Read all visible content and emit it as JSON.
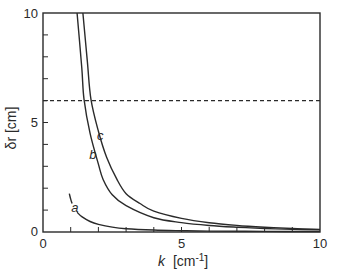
{
  "chart_data": {
    "type": "line",
    "title": "",
    "xlabel": "k [cm-1]",
    "xlabel_var": "k",
    "xlabel_unit": "[cm",
    "xlabel_exp": "-1",
    "xlabel_close": "]",
    "ylabel": "δr [cm]",
    "xlim": [
      0,
      10
    ],
    "ylim": [
      0,
      10
    ],
    "x_ticks_major": [
      0,
      5,
      10
    ],
    "x_tick_labels": [
      "0",
      "5",
      "10"
    ],
    "x_ticks_minor_step": 1,
    "y_ticks_major": [
      0,
      5,
      10
    ],
    "y_tick_labels": [
      "0",
      "5",
      "10"
    ],
    "y_ticks_minor_step": 1,
    "grid": false,
    "legend": "none",
    "reference_line": {
      "y": 6,
      "style": "dashed"
    },
    "series": [
      {
        "name": "a",
        "label_pos": [
          1.15,
          1.1
        ],
        "segments": [
          {
            "x": [
              0.95,
              1.0,
              1.05
            ],
            "y": [
              1.75,
              1.5,
              1.3
            ]
          },
          {
            "x": [
              1.23,
              1.4,
              1.7,
              2.0,
              2.5,
              3.0,
              4.0,
              5.0,
              6.0,
              8.0,
              10.0
            ],
            "y": [
              0.9,
              0.7,
              0.48,
              0.35,
              0.22,
              0.15,
              0.09,
              0.06,
              0.04,
              0.03,
              0.02
            ]
          }
        ]
      },
      {
        "name": "b",
        "label_pos": [
          1.8,
          3.5
        ],
        "segments": [
          {
            "x": [
              1.23,
              1.4,
              1.48,
              1.7,
              2.0,
              2.17,
              2.5,
              3.0,
              4.0,
              5.0,
              6.0,
              7.0,
              8.0,
              9.0,
              10.0
            ],
            "y": [
              10,
              7.5,
              6.07,
              4.5,
              3.1,
              2.4,
              1.7,
              1.2,
              0.65,
              0.43,
              0.3,
              0.22,
              0.16,
              0.12,
              0.1
            ]
          }
        ]
      },
      {
        "name": "c",
        "label_pos": [
          2.07,
          4.4
        ],
        "segments": [
          {
            "x": [
              1.44,
              1.6,
              1.73,
              2.0,
              2.3,
              2.67,
              3.0,
              3.5,
              4.0,
              5.0,
              6.0,
              7.0,
              8.0,
              9.0,
              10.0
            ],
            "y": [
              10,
              7.8,
              6.07,
              4.6,
              3.4,
              2.4,
              1.75,
              1.3,
              0.95,
              0.62,
              0.42,
              0.3,
              0.22,
              0.16,
              0.12
            ]
          }
        ]
      }
    ]
  }
}
